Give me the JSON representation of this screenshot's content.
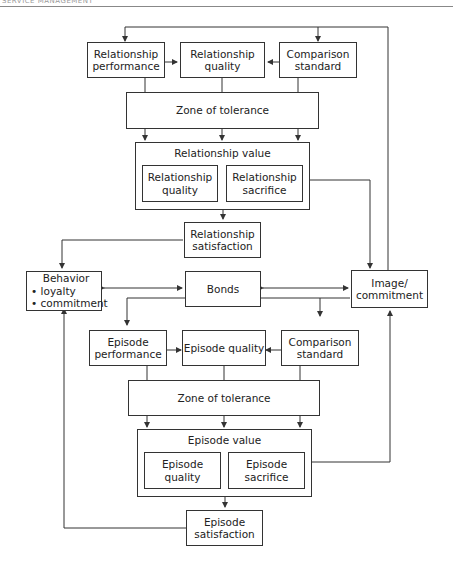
{
  "header": {
    "running_head": "SERVICE MANAGEMENT"
  },
  "relationship_level": {
    "performance": [
      "Relationship",
      "performance"
    ],
    "quality": [
      "Relationship",
      "quality"
    ],
    "comparison_standard": [
      "Comparison",
      "standard"
    ],
    "zone_of_tolerance": "Zone of tolerance",
    "value": {
      "title": "Relationship value",
      "quality": [
        "Relationship",
        "quality"
      ],
      "sacrifice": [
        "Relationship",
        "sacrifice"
      ]
    },
    "satisfaction": [
      "Relationship",
      "satisfaction"
    ]
  },
  "middle": {
    "behavior": {
      "title": "Behavior",
      "bullets": [
        "loyalty",
        "commitment"
      ],
      "bullet_char": "•"
    },
    "bonds": "Bonds",
    "image": [
      "Image/",
      "commitment"
    ]
  },
  "episode_level": {
    "performance": [
      "Episode",
      "performance"
    ],
    "quality": "Episode quality",
    "comparison_standard": [
      "Comparison",
      "standard"
    ],
    "zone_of_tolerance": "Zone of tolerance",
    "value": {
      "title": "Episode value",
      "quality": [
        "Episode",
        "quality"
      ],
      "sacrifice": [
        "Episode",
        "sacrifice"
      ]
    },
    "satisfaction": [
      "Episode",
      "satisfaction"
    ]
  },
  "colors": {
    "line": "#333333",
    "background": "#ffffff"
  }
}
